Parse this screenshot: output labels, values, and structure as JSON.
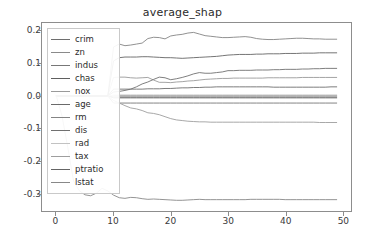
{
  "chart_data": {
    "type": "line",
    "title": "average_shap",
    "xlabel": "",
    "ylabel": "",
    "xlim": [
      -2.5,
      51.5
    ],
    "ylim": [
      -0.355,
      0.225
    ],
    "grid": false,
    "legend_position": "upper left",
    "xticks": [
      "0",
      "10",
      "20",
      "30",
      "40",
      "50"
    ],
    "xtick_values": [
      0,
      10,
      20,
      30,
      40,
      50
    ],
    "yticks": [
      "0.2",
      "0.1",
      "0.0",
      "-0.1",
      "-0.2",
      "-0.3"
    ],
    "ytick_values": [
      0.2,
      0.1,
      0.0,
      -0.1,
      -0.2,
      -0.3
    ],
    "x": [
      0,
      1,
      2,
      3,
      4,
      5,
      6,
      7,
      8,
      9,
      10,
      11,
      12,
      13,
      14,
      15,
      16,
      17,
      18,
      19,
      20,
      21,
      22,
      23,
      24,
      25,
      26,
      27,
      28,
      29,
      30,
      31,
      32,
      33,
      34,
      35,
      36,
      37,
      38,
      39,
      40,
      41,
      42,
      43,
      44,
      45,
      46,
      47,
      48,
      49
    ],
    "series": [
      {
        "name": "crim",
        "color": "#6e6e6e",
        "values": [
          0.0,
          0.0,
          0.0,
          0.0,
          0.0,
          0.0,
          0.0,
          0.0,
          0.0,
          0.0,
          0.021,
          0.021,
          0.021,
          0.021,
          0.021,
          0.021,
          0.022,
          0.022,
          0.022,
          0.023,
          0.023,
          0.024,
          0.025,
          0.025,
          0.026,
          0.026,
          0.027,
          0.027,
          0.028,
          0.028,
          0.028,
          0.028,
          0.028,
          0.028,
          0.028,
          0.028,
          0.028,
          0.028,
          0.027,
          0.027,
          0.027,
          0.027,
          0.027,
          0.027,
          0.027,
          0.027,
          0.027,
          0.027,
          0.028,
          0.028
        ]
      },
      {
        "name": "zn",
        "color": "#8a8a8a",
        "values": [
          0.0,
          0.0,
          0.0,
          0.0,
          0.0,
          0.0,
          0.0,
          0.0,
          0.0,
          0.0,
          -0.004,
          -0.004,
          -0.004,
          -0.004,
          -0.004,
          -0.004,
          -0.004,
          -0.004,
          -0.004,
          -0.004,
          -0.004,
          -0.004,
          -0.004,
          -0.004,
          -0.004,
          -0.004,
          -0.004,
          -0.004,
          -0.004,
          -0.004,
          -0.004,
          -0.004,
          -0.004,
          -0.004,
          -0.004,
          -0.004,
          -0.004,
          -0.004,
          -0.004,
          -0.004,
          -0.004,
          -0.004,
          -0.004,
          -0.004,
          -0.004,
          -0.004,
          -0.004,
          -0.004,
          -0.004,
          -0.004
        ]
      },
      {
        "name": "indus",
        "color": "#777777",
        "values": [
          0.0,
          0.0,
          0.0,
          0.0,
          0.0,
          0.0,
          0.0,
          0.0,
          0.0,
          0.0,
          -0.022,
          -0.022,
          -0.022,
          -0.022,
          -0.022,
          -0.022,
          -0.022,
          -0.022,
          -0.022,
          -0.022,
          -0.022,
          -0.022,
          -0.022,
          -0.022,
          -0.022,
          -0.022,
          -0.022,
          -0.022,
          -0.022,
          -0.022,
          -0.022,
          -0.022,
          -0.022,
          -0.022,
          -0.022,
          -0.022,
          -0.022,
          -0.022,
          -0.022,
          -0.022,
          -0.022,
          -0.022,
          -0.022,
          -0.022,
          -0.022,
          -0.022,
          -0.022,
          -0.022,
          -0.022,
          -0.022
        ]
      },
      {
        "name": "chas",
        "color": "#5f5f5f",
        "values": [
          0.0,
          0.0,
          0.0,
          0.0,
          0.0,
          0.0,
          0.0,
          0.0,
          0.0,
          0.0,
          0.0,
          0.0,
          0.0,
          0.0,
          0.0,
          0.0,
          0.0,
          0.0,
          0.0,
          0.0,
          0.0,
          0.0,
          0.0,
          0.0,
          0.0,
          0.0,
          0.0,
          0.0,
          0.0,
          0.0,
          0.0,
          0.0,
          0.0,
          0.0,
          0.0,
          0.0,
          0.0,
          0.0,
          0.0,
          0.0,
          0.0,
          0.0,
          0.0,
          0.0,
          0.0,
          0.0,
          0.0,
          0.0,
          0.0,
          0.0
        ]
      },
      {
        "name": "nox",
        "color": "#9a9a9a",
        "values": [
          0.0,
          0.0,
          0.0,
          0.0,
          0.0,
          0.0,
          0.0,
          0.0,
          0.0,
          0.0,
          0.057,
          0.058,
          0.058,
          0.056,
          0.055,
          0.056,
          0.057,
          0.049,
          0.042,
          0.042,
          0.041,
          0.043,
          0.044,
          0.046,
          0.047,
          0.049,
          0.051,
          0.052,
          0.053,
          0.054,
          0.054,
          0.055,
          0.055,
          0.055,
          0.055,
          0.055,
          0.055,
          0.056,
          0.056,
          0.056,
          0.056,
          0.056,
          0.056,
          0.057,
          0.057,
          0.057,
          0.057,
          0.057,
          0.057,
          0.057
        ]
      },
      {
        "name": "age",
        "color": "#6a6a6a",
        "values": [
          0.0,
          0.0,
          0.0,
          0.0,
          0.0,
          0.0,
          0.0,
          0.0,
          0.0,
          0.0,
          -0.006,
          -0.006,
          -0.006,
          -0.006,
          -0.006,
          -0.006,
          -0.006,
          -0.006,
          -0.006,
          -0.006,
          -0.006,
          -0.006,
          -0.006,
          -0.006,
          -0.006,
          -0.006,
          -0.006,
          -0.006,
          -0.006,
          -0.006,
          -0.006,
          -0.006,
          -0.006,
          -0.006,
          -0.006,
          -0.006,
          -0.006,
          -0.006,
          -0.006,
          -0.006,
          -0.006,
          -0.006,
          -0.006,
          -0.006,
          -0.006,
          -0.006,
          -0.006,
          -0.006,
          -0.006,
          -0.006
        ]
      },
      {
        "name": "rm",
        "color": "#848484",
        "values": [
          0.0,
          0.0,
          0.0,
          0.0,
          0.0,
          0.0,
          0.0,
          0.0,
          0.0,
          0.0,
          0.151,
          0.16,
          0.155,
          0.157,
          0.16,
          0.163,
          0.177,
          0.181,
          0.18,
          0.176,
          0.185,
          0.188,
          0.19,
          0.194,
          0.196,
          0.191,
          0.186,
          0.184,
          0.182,
          0.18,
          0.18,
          0.181,
          0.182,
          0.183,
          0.181,
          0.177,
          0.175,
          0.174,
          0.174,
          0.175,
          0.176,
          0.177,
          0.178,
          0.178,
          0.177,
          0.176,
          0.176,
          0.175,
          0.175,
          0.175
        ]
      },
      {
        "name": "dis",
        "color": "#707070",
        "values": [
          0.0,
          0.0,
          0.0,
          0.0,
          0.0,
          0.0,
          0.0,
          0.0,
          0.0,
          0.0,
          0.012,
          0.014,
          0.017,
          0.021,
          0.028,
          0.037,
          0.043,
          0.051,
          0.058,
          0.056,
          0.05,
          0.053,
          0.057,
          0.062,
          0.068,
          0.072,
          0.07,
          0.07,
          0.072,
          0.074,
          0.078,
          0.078,
          0.079,
          0.079,
          0.079,
          0.08,
          0.08,
          0.08,
          0.081,
          0.081,
          0.082,
          0.082,
          0.082,
          0.083,
          0.083,
          0.084,
          0.084,
          0.085,
          0.085,
          0.085
        ]
      },
      {
        "name": "rad",
        "color": "#c2c2c2",
        "values": [
          0.0,
          0.0,
          0.0,
          0.0,
          0.0,
          0.0,
          0.0,
          0.0,
          0.0,
          0.0,
          0.003,
          0.003,
          0.003,
          0.003,
          0.003,
          0.003,
          0.003,
          0.003,
          0.003,
          0.003,
          0.003,
          0.003,
          0.003,
          0.003,
          0.003,
          0.003,
          0.003,
          0.003,
          0.003,
          0.003,
          0.003,
          0.003,
          0.003,
          0.003,
          0.003,
          0.003,
          0.003,
          0.003,
          0.003,
          0.003,
          0.003,
          0.003,
          0.003,
          0.003,
          0.003,
          0.003,
          0.003,
          0.003,
          0.003,
          0.003
        ]
      },
      {
        "name": "tax",
        "color": "#9e9e9e",
        "values": [
          0.0,
          0.0,
          0.0,
          0.0,
          0.0,
          0.0,
          0.0,
          0.0,
          0.0,
          0.0,
          -0.014,
          -0.022,
          -0.03,
          -0.037,
          -0.04,
          -0.045,
          -0.052,
          -0.054,
          -0.058,
          -0.064,
          -0.07,
          -0.074,
          -0.076,
          -0.078,
          -0.079,
          -0.08,
          -0.08,
          -0.081,
          -0.081,
          -0.081,
          -0.081,
          -0.081,
          -0.081,
          -0.081,
          -0.081,
          -0.081,
          -0.081,
          -0.081,
          -0.081,
          -0.081,
          -0.081,
          -0.081,
          -0.081,
          -0.081,
          -0.081,
          -0.081,
          -0.082,
          -0.082,
          -0.082,
          -0.082
        ]
      },
      {
        "name": "ptratio",
        "color": "#656565",
        "values": [
          0.0,
          0.0,
          0.0,
          0.0,
          0.0,
          0.0,
          0.0,
          0.0,
          0.0,
          0.0,
          0.108,
          0.118,
          0.12,
          0.12,
          0.12,
          0.121,
          0.121,
          0.12,
          0.119,
          0.118,
          0.118,
          0.117,
          0.116,
          0.117,
          0.118,
          0.119,
          0.12,
          0.121,
          0.122,
          0.124,
          0.126,
          0.127,
          0.128,
          0.128,
          0.128,
          0.129,
          0.129,
          0.13,
          0.13,
          0.13,
          0.131,
          0.131,
          0.131,
          0.132,
          0.132,
          0.132,
          0.133,
          0.133,
          0.133,
          0.133
        ]
      },
      {
        "name": "lstat",
        "color": "#888888",
        "values": [
          0.0,
          -0.062,
          -0.158,
          -0.262,
          -0.292,
          -0.305,
          -0.308,
          -0.3,
          -0.285,
          -0.293,
          -0.306,
          -0.314,
          -0.316,
          -0.313,
          -0.314,
          -0.317,
          -0.319,
          -0.318,
          -0.319,
          -0.32,
          -0.321,
          -0.322,
          -0.322,
          -0.321,
          -0.32,
          -0.319,
          -0.32,
          -0.32,
          -0.32,
          -0.32,
          -0.32,
          -0.32,
          -0.32,
          -0.32,
          -0.319,
          -0.319,
          -0.319,
          -0.319,
          -0.319,
          -0.319,
          -0.32,
          -0.32,
          -0.32,
          -0.32,
          -0.32,
          -0.32,
          -0.32,
          -0.32,
          -0.32,
          -0.32
        ]
      }
    ]
  },
  "axes": {
    "frame_color": "#8d8d8d",
    "tick_color": "#3a3a3a"
  }
}
